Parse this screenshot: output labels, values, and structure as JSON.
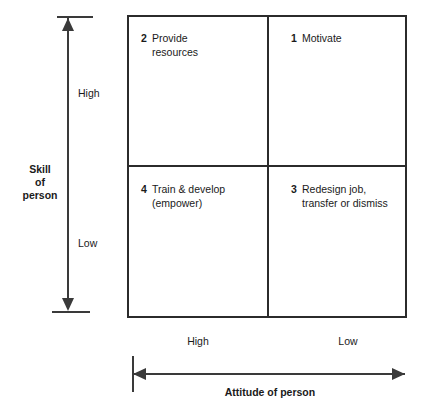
{
  "diagram": {
    "type": "2x2-matrix",
    "line_color": "#2b2b2b",
    "axis_color": "#3a3a3a",
    "background": "#ffffff",
    "quadrants": [
      {
        "number": "1",
        "position": "top-right",
        "lines": [
          "Motivate"
        ],
        "line1": "Motivate",
        "line2": ""
      },
      {
        "number": "2",
        "position": "top-left",
        "lines": [
          "Provide",
          "resources"
        ],
        "line1": "Provide",
        "line2": "resources"
      },
      {
        "number": "3",
        "position": "bottom-right",
        "lines": [
          "Redesign job,",
          "transfer or dismiss"
        ],
        "line1": "Redesign job,",
        "line2": "transfer or dismiss"
      },
      {
        "number": "4",
        "position": "bottom-left",
        "lines": [
          "Train & develop",
          "(empower)"
        ],
        "line1": "Train & develop",
        "line2": "(empower)"
      }
    ],
    "y_axis": {
      "title_line1": "Skill",
      "title_line2": "of",
      "title_line3": "person",
      "high_label": "High",
      "low_label": "Low"
    },
    "x_axis": {
      "title": "Attitude of person",
      "high_label": "High",
      "low_label": "Low"
    }
  }
}
